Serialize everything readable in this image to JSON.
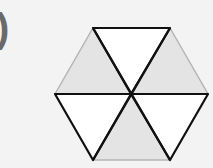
{
  "problem_label": ")",
  "figure": {
    "shape": "hexagon",
    "divisions": 6,
    "shaded_count": 3,
    "colors": {
      "background": "#f3f3f3",
      "shaded_fill": "#e4e4e4",
      "white_fill": "#ffffff",
      "bold_stroke": "#111111",
      "light_stroke": "#b5b5b5"
    },
    "triangles": [
      {
        "position": "top",
        "shaded": false,
        "points": "93,28 170,28 131,94"
      },
      {
        "position": "upper-right",
        "shaded": true,
        "points": "170,28 208,94 131,94"
      },
      {
        "position": "lower-right",
        "shaded": false,
        "points": "208,94 170,160 131,94"
      },
      {
        "position": "bottom",
        "shaded": true,
        "points": "170,160 93,160 131,94"
      },
      {
        "position": "lower-left",
        "shaded": false,
        "points": "93,160 55,94 131,94"
      },
      {
        "position": "upper-left",
        "shaded": true,
        "points": "55,94 93,28 131,94"
      }
    ]
  }
}
